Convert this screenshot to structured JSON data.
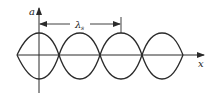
{
  "diagram": {
    "type": "standing-wave-envelope",
    "y_axis_label": "a",
    "x_axis_label": "x",
    "wavelength_label": "λ",
    "wavelength_subscript": "s",
    "line_color": "#2a2a2a",
    "loops": 4,
    "geometry": {
      "x_axis_y": 55,
      "y_axis_x": 39,
      "amplitude_top": 33,
      "amplitude_bottom": 79,
      "envelope_start_x": 17,
      "nodes_x": [
        59,
        100,
        142
      ],
      "envelope_end_x": 183,
      "antinodes_x": [
        39,
        80,
        121,
        162
      ],
      "dimension_line_y": 24,
      "dimension_from_x": 39,
      "dimension_to_x": 121
    }
  }
}
